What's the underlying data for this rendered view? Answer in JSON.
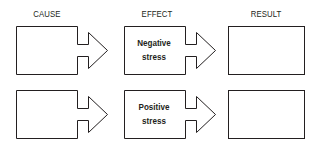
{
  "diagram": {
    "headers": {
      "cause": "CAUSE",
      "effect": "EFFECT",
      "result": "RESULT"
    },
    "rows": [
      {
        "cause_text": "",
        "effect_line1": "Negative",
        "effect_line2": "stress",
        "result_text": ""
      },
      {
        "cause_text": "",
        "effect_line1": "Positive",
        "effect_line2": "stress",
        "result_text": ""
      }
    ],
    "stroke_color": "#231f20",
    "background": "#ffffff"
  }
}
